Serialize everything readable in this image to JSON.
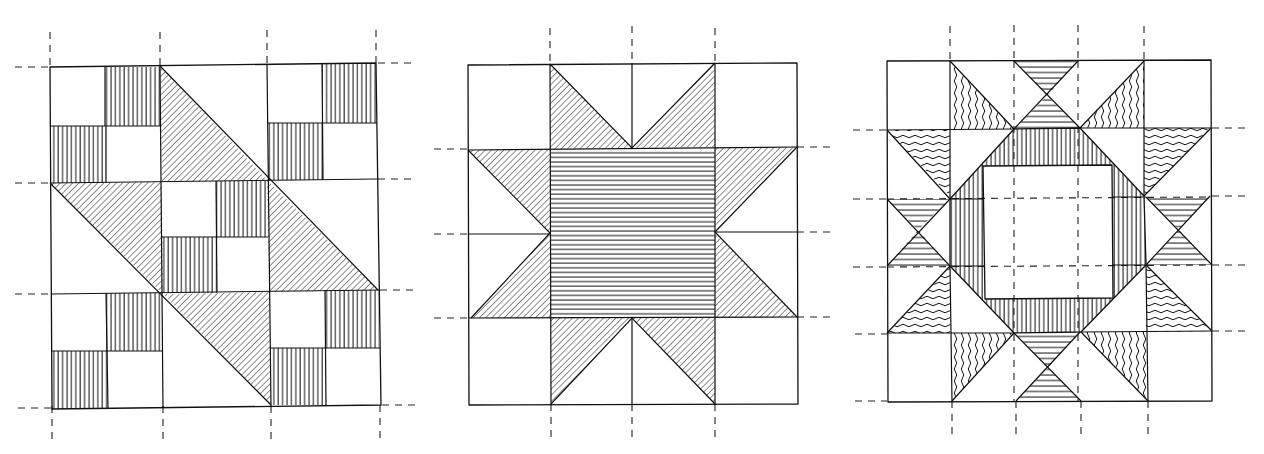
{
  "figure": {
    "description": "Three hand-drawn quilt block designs with hatched fabric patches and dashed seam/grid guide lines",
    "colors": {
      "ink": "#111111",
      "paper": "#ffffff"
    }
  },
  "blocks": [
    {
      "id": "block-1",
      "name": "diagonal-nine-patch-block",
      "grid": "3x3",
      "patterns": [
        "vertical-stripes",
        "diagonal-hatch"
      ]
    },
    {
      "id": "block-2",
      "name": "sawtooth-star-block",
      "grid": "4x4",
      "patterns": [
        "diagonal-hatch",
        "horizontal-stripes"
      ]
    },
    {
      "id": "block-3",
      "name": "ring-star-block",
      "grid": "5x5",
      "patterns": [
        "wavy-lines",
        "horizontal-stripes",
        "vertical-stripes"
      ]
    }
  ]
}
